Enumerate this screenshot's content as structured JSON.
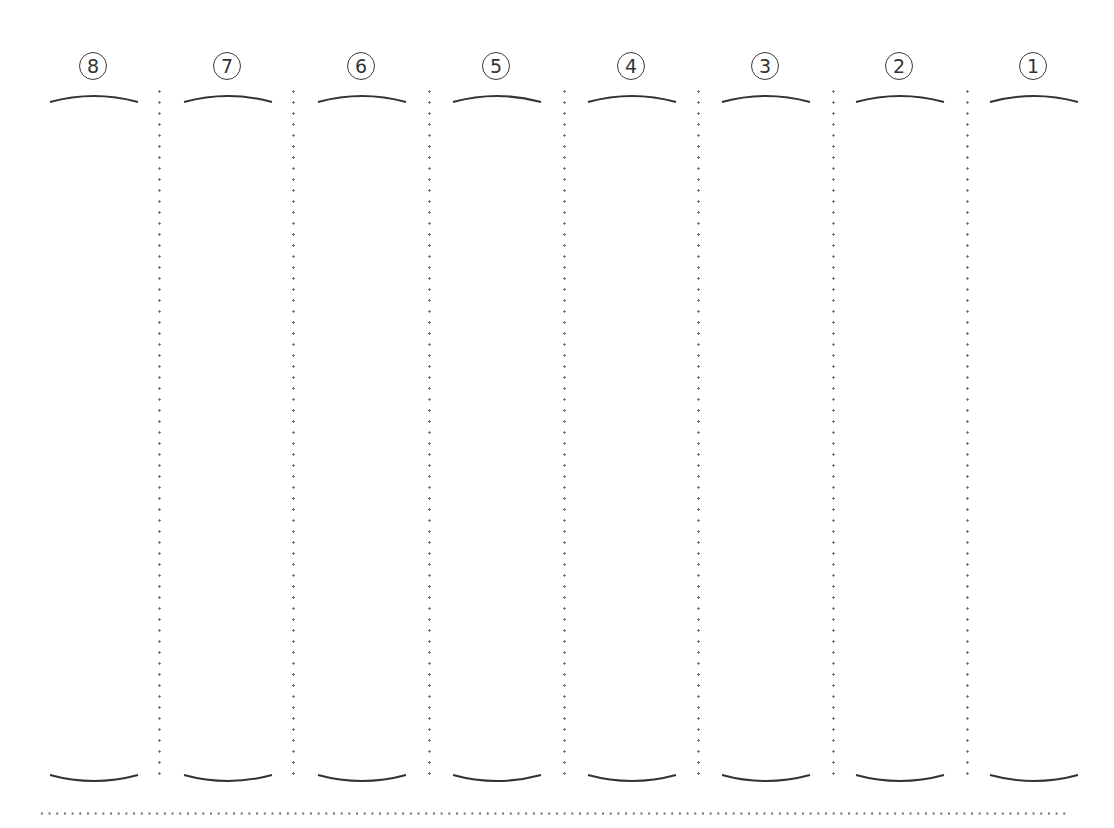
{
  "worksheet": {
    "columns": [
      {
        "label": "⑧",
        "number": 8
      },
      {
        "label": "⑦",
        "number": 7
      },
      {
        "label": "⑥",
        "number": 6
      },
      {
        "label": "⑤",
        "number": 5
      },
      {
        "label": "④",
        "number": 4
      },
      {
        "label": "③",
        "number": 3
      },
      {
        "label": "②",
        "number": 2
      },
      {
        "label": "①",
        "number": 1
      }
    ],
    "plain_numbers": [
      "8",
      "7",
      "6",
      "5",
      "4",
      "3",
      "2",
      "1"
    ],
    "colors": {
      "ink": "#333333",
      "dots": "#777777",
      "background": "#ffffff"
    }
  }
}
